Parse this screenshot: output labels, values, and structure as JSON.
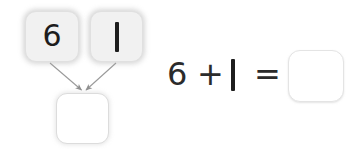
{
  "worksheet": {
    "type": "number-bond-addition-worksheet",
    "background_color": "#ffffff"
  },
  "number_bond": {
    "label": "number-bond",
    "addend_1": "6",
    "addend_2": "1",
    "sum": "",
    "sum_is_blank": true,
    "arrow_count": 2,
    "box_fill_color": "#f1f1f1",
    "box_shadow_color": "#a8a8a8",
    "sum_box_fill_color": "#ffffff",
    "arrow_color": "#8f8f8f",
    "digit_color": "#1d1d1d"
  },
  "equation": {
    "addend_1": "6",
    "operator": "+",
    "addend_2": "1",
    "equals": "=",
    "answer": "",
    "answer_is_blank": true,
    "full_text": "6 + 1 =",
    "text_color": "#2b2b2b",
    "answer_box_border_color": "#e4e4e4",
    "answer_box_fill_color": "#ffffff"
  }
}
